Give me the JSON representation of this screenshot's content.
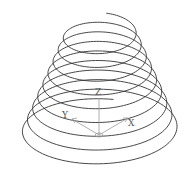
{
  "diagram": {
    "type": "conical-helix",
    "stroke_color": "#333333",
    "axis_color": "#999999",
    "helix": {
      "turns": 9,
      "top": {
        "cx": 101,
        "cy": 30,
        "rx": 34,
        "ry": 17
      },
      "bottom": {
        "cx": 101,
        "cy": 135,
        "rx": 80,
        "ry": 36
      }
    },
    "axes": {
      "origin": {
        "x": 99,
        "y": 135
      },
      "labels": {
        "x": "X",
        "y": "Y",
        "z": "Z"
      }
    }
  }
}
